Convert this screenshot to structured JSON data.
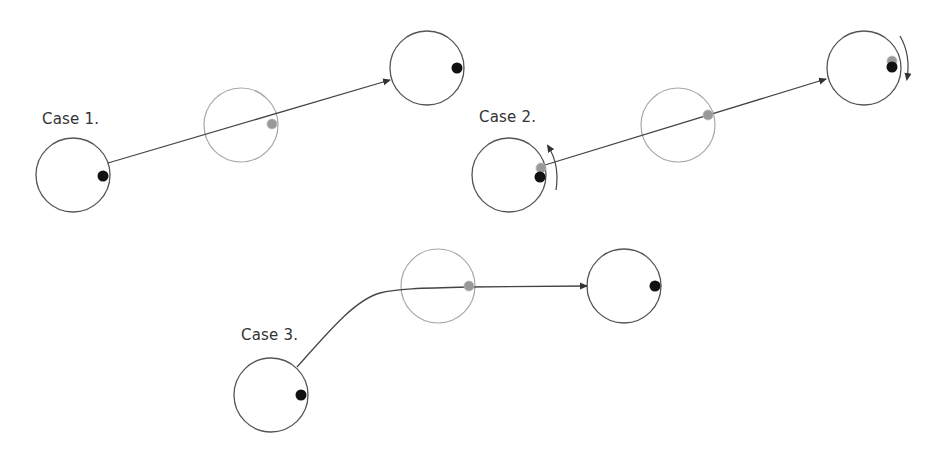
{
  "figure": {
    "colors": {
      "outline": "#555555",
      "ghost_outline": "#a8a8a8",
      "path": "#444444",
      "dot_black": "#111111",
      "dot_gray": "#999999"
    },
    "circle_radius": 37,
    "cases": [
      {
        "label": "Case 1.",
        "label_pos": [
          42,
          112
        ],
        "start": {
          "center": [
            73,
            175
          ],
          "dots": [
            {
              "type": "black",
              "pos": [
                103,
                176
              ]
            }
          ]
        },
        "middle": {
          "center": [
            241,
            125
          ],
          "ghost": true,
          "dots": [
            {
              "type": "gray",
              "pos": [
                272,
                124
              ]
            }
          ]
        },
        "end": {
          "center": [
            427,
            68
          ],
          "dots": [
            {
              "type": "black",
              "pos": [
                457,
                68
              ]
            }
          ]
        },
        "path": {
          "type": "straight",
          "from": [
            108,
            163
          ],
          "to": [
            390,
            80
          ]
        },
        "rotation_arrows": []
      },
      {
        "label": "Case 2.",
        "label_pos": [
          479,
          110
        ],
        "start": {
          "center": [
            509,
            175
          ],
          "dots": [
            {
              "type": "gray",
              "pos": [
                541,
                168
              ]
            },
            {
              "type": "black",
              "pos": [
                540,
                177
              ]
            }
          ]
        },
        "middle": {
          "center": [
            678,
            125
          ],
          "ghost": true,
          "dots": [
            {
              "type": "gray",
              "pos": [
                708,
                115
              ]
            }
          ]
        },
        "end": {
          "center": [
            864,
            68
          ],
          "dots": [
            {
              "type": "gray",
              "pos": [
                892,
                61
              ]
            },
            {
              "type": "black",
              "pos": [
                892,
                67
              ]
            }
          ]
        },
        "path": {
          "type": "straight",
          "from": [
            545,
            165
          ],
          "to": [
            826,
            79
          ]
        },
        "rotation_arrows": [
          {
            "at": "start",
            "direction": "counter-clockwise (upward)"
          },
          {
            "at": "end",
            "direction": "clockwise (downward)"
          }
        ]
      },
      {
        "label": "Case 3.",
        "label_pos": [
          241,
          328
        ],
        "start": {
          "center": [
            271,
            395
          ],
          "dots": [
            {
              "type": "black",
              "pos": [
                301,
                395
              ]
            }
          ]
        },
        "middle": {
          "center": [
            438,
            286
          ],
          "ghost": true,
          "dots": [
            {
              "type": "gray",
              "pos": [
                469,
                286
              ]
            }
          ]
        },
        "end": {
          "center": [
            624,
            286
          ],
          "dots": [
            {
              "type": "black",
              "pos": [
                655,
                286
              ]
            }
          ]
        },
        "path": {
          "type": "curved-then-straight",
          "from": [
            297,
            367
          ],
          "to": [
            587,
            286
          ]
        },
        "rotation_arrows": []
      }
    ]
  }
}
